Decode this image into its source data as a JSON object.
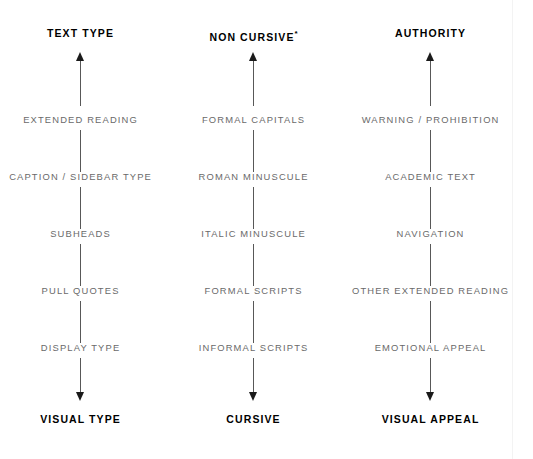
{
  "diagram": {
    "type": "three-axis-continuum",
    "background_color": "#ffffff",
    "header_color": "#000000",
    "label_color": "#6a6a6a",
    "axis_color": "#585858",
    "columns": [
      {
        "id": "text-type",
        "top_label": "TEXT TYPE",
        "bottom_label": "VISUAL TYPE",
        "steps": [
          "EXTENDED READING",
          "CAPTION / SIDEBAR TYPE",
          "SUBHEADS",
          "PULL QUOTES",
          "DISPLAY TYPE"
        ]
      },
      {
        "id": "non-cursive",
        "top_label": "NON CURSIVE",
        "top_label_marker": "*",
        "bottom_label": "CURSIVE",
        "steps": [
          "FORMAL CAPITALS",
          "ROMAN MINUSCULE",
          "ITALIC MINUSCULE",
          "FORMAL SCRIPTS",
          "INFORMAL SCRIPTS"
        ]
      },
      {
        "id": "authority",
        "top_label": "AUTHORITY",
        "bottom_label": "VISUAL APPEAL",
        "steps": [
          "WARNING / PROHIBITION",
          "ACADEMIC TEXT",
          "NAVIGATION",
          "OTHER EXTENDED READING",
          "EMOTIONAL APPEAL"
        ]
      }
    ]
  }
}
